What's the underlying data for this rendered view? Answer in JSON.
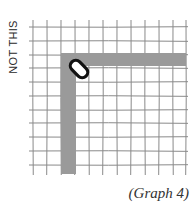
{
  "figure": {
    "side_label": "NOT THIS",
    "caption": "(Graph 4)",
    "grid": {
      "x_lines": [
        33,
        47,
        61,
        75,
        89,
        103,
        117,
        131,
        145,
        159,
        173,
        186
      ],
      "y_lines": [
        27,
        41,
        55,
        68,
        82,
        96,
        110,
        123,
        137,
        151,
        165
      ],
      "top": 20,
      "bottom": 175,
      "color": "#8a8a8a"
    },
    "path": {
      "color": "#9a9a9a",
      "vertical": {
        "x": 61,
        "y": 53,
        "w": 15,
        "h": 121
      },
      "horizontal": {
        "x": 61,
        "y": 53,
        "w": 125,
        "h": 13
      }
    },
    "capsule": {
      "cx": 79,
      "cy": 69,
      "length": 20,
      "width": 11,
      "angle": 45,
      "color": "#111111"
    }
  }
}
